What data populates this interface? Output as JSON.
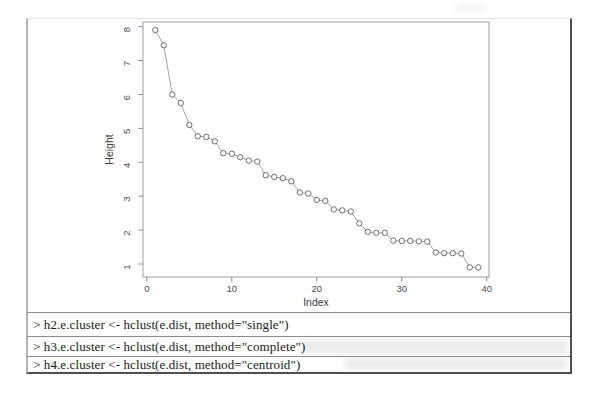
{
  "chart_data": {
    "type": "line",
    "title": "",
    "xlabel": "Index",
    "ylabel": "Height",
    "x": [
      1,
      2,
      3,
      4,
      5,
      6,
      7,
      8,
      9,
      10,
      11,
      12,
      13,
      14,
      15,
      16,
      17,
      18,
      19,
      20,
      21,
      22,
      23,
      24,
      25,
      26,
      27,
      28,
      29,
      30,
      31,
      32,
      33,
      34,
      35,
      36,
      37,
      38,
      39
    ],
    "values": [
      7.9,
      7.45,
      6.0,
      5.75,
      5.1,
      4.77,
      4.75,
      4.62,
      4.27,
      4.25,
      4.15,
      4.05,
      4.02,
      3.62,
      3.57,
      3.53,
      3.44,
      3.11,
      3.08,
      2.89,
      2.86,
      2.61,
      2.58,
      2.55,
      2.2,
      1.95,
      1.92,
      1.92,
      1.69,
      1.68,
      1.68,
      1.67,
      1.66,
      1.34,
      1.32,
      1.32,
      1.31,
      0.9,
      0.9
    ],
    "xticks": [
      0,
      10,
      20,
      30,
      40
    ],
    "yticks": [
      1,
      2,
      3,
      4,
      5,
      6,
      7,
      8
    ],
    "xlim": [
      -0.5,
      40.5
    ],
    "ylim": [
      0.6,
      8.5
    ],
    "grid": false,
    "legend": "none",
    "marker": "open-circle",
    "series_name": "sorted cluster merge heights"
  },
  "console": {
    "lines": [
      "> h2.e.cluster <- hclust(e.dist, method=\"single\")",
      "> h3.e.cluster <- hclust(e.dist, method=\"complete\")",
      "> h4.e.cluster <- hclust(e.dist, method=\"centroid\")"
    ]
  },
  "colors": {
    "curve_line": "#8a8a8a",
    "marker_stroke": "#5f5f5f",
    "marker_fill": "#ffffff",
    "plot_box": "#9e9e9e",
    "tick": "#8a8a8a",
    "tick_text": "#4d4d4d",
    "axis_label_text": "#3d3d3d",
    "code_text": "#1b1b1b",
    "frame_dark": "#4f4f4f",
    "frame_light": "#b3b3b3"
  }
}
